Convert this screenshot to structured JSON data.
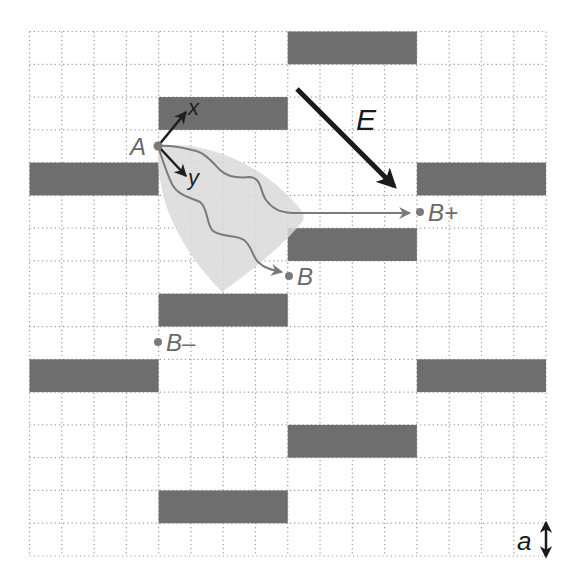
{
  "diagram": {
    "grid": {
      "cols": 16,
      "rows": 16,
      "left": 29.5,
      "top": 31.5,
      "right": 546,
      "bottom": 556,
      "line_color": "#9a9a9a"
    },
    "colors": {
      "obstacle": "#6e6e6e",
      "path": "#7a7a7a",
      "cone": "#d9d9d9",
      "label": "#6a6a6a",
      "axis": "#1e1e1e",
      "field": "#1a1a1a"
    },
    "obstacles": [
      {
        "col": 8,
        "row": 0,
        "w": 4,
        "h": 1
      },
      {
        "col": 4,
        "row": 2,
        "w": 4,
        "h": 1
      },
      {
        "col": 0,
        "row": 4,
        "w": 4,
        "h": 1
      },
      {
        "col": 12,
        "row": 4,
        "w": 4,
        "h": 1
      },
      {
        "col": 8,
        "row": 6,
        "w": 4,
        "h": 1
      },
      {
        "col": 4,
        "row": 8,
        "w": 4,
        "h": 1
      },
      {
        "col": 0,
        "row": 10,
        "w": 4,
        "h": 1
      },
      {
        "col": 12,
        "row": 10,
        "w": 4,
        "h": 1
      },
      {
        "col": 8,
        "row": 12,
        "w": 4,
        "h": 1
      },
      {
        "col": 4,
        "row": 14,
        "w": 4,
        "h": 1
      }
    ],
    "points": {
      "A": {
        "label": "A",
        "x": 158,
        "y": 146
      },
      "B": {
        "label": "B",
        "x": 289,
        "y": 276
      },
      "B_plus": {
        "label": "B+",
        "x": 420,
        "y": 212
      },
      "B_minus": {
        "label": "B–",
        "x": 158,
        "y": 342
      }
    },
    "axes": {
      "x_label": "x",
      "y_label": "y"
    },
    "field": {
      "label": "E"
    },
    "scale": {
      "label": "a"
    }
  }
}
